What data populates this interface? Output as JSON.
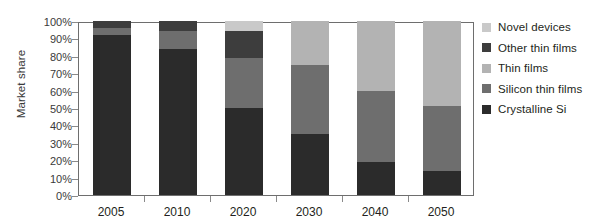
{
  "chart_data": {
    "type": "bar",
    "subtype": "stacked-100-percent",
    "title": "",
    "xlabel": "",
    "ylabel": "Market share",
    "ylim": [
      0,
      100
    ],
    "ytick_labels": [
      "100%",
      "90%",
      "80%",
      "70%",
      "60%",
      "50%",
      "40%",
      "30%",
      "20%",
      "10%",
      "0%"
    ],
    "ytick_values": [
      100,
      90,
      80,
      70,
      60,
      50,
      40,
      30,
      20,
      10,
      0
    ],
    "grid": false,
    "legend_position": "right",
    "categories": [
      "2005",
      "2010",
      "2020",
      "2030",
      "2040",
      "2050"
    ],
    "series": [
      {
        "name": "Crystalline Si",
        "color": "#2b2b2b",
        "values": [
          92,
          84,
          50,
          35,
          19,
          14
        ]
      },
      {
        "name": "Silicon thin films",
        "color": "#6e6e6e",
        "values": [
          4,
          10,
          29,
          40,
          41,
          37
        ]
      },
      {
        "name": "Thin films",
        "color": "#b3b3b3",
        "values": [
          0,
          0,
          0,
          25,
          40,
          49
        ]
      },
      {
        "name": "Other thin films",
        "color": "#3d3d3d",
        "values": [
          4,
          6,
          15,
          0,
          0,
          0
        ]
      },
      {
        "name": "Novel devices",
        "color": "#c9c9c9",
        "values": [
          0,
          0,
          6,
          0,
          0,
          0
        ]
      }
    ],
    "stack_order_bottom_to_top": [
      "Crystalline Si",
      "Silicon thin films",
      "Thin films",
      "Other thin films",
      "Novel devices"
    ],
    "legend": [
      {
        "label": "Novel devices",
        "color": "#c9c9c9"
      },
      {
        "label": "Other thin films",
        "color": "#3d3d3d"
      },
      {
        "label": "Thin films",
        "color": "#b3b3b3"
      },
      {
        "label": "Silicon thin films",
        "color": "#6e6e6e"
      },
      {
        "label": "Crystalline Si",
        "color": "#2b2b2b"
      }
    ]
  }
}
